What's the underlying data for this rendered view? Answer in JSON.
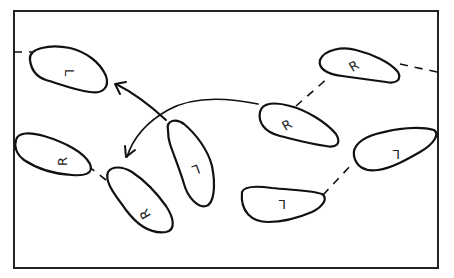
{
  "diagram": {
    "colors": {
      "ink": "#111111",
      "background": "#ffffff"
    },
    "footprints": [
      {
        "id": "f1",
        "side": "L",
        "label": "L",
        "cx": 64,
        "cy": 72
      },
      {
        "id": "f2",
        "side": "R",
        "label": "R",
        "cx": 52,
        "cy": 160
      },
      {
        "id": "f3",
        "side": "R",
        "label": "R",
        "cx": 142,
        "cy": 209
      },
      {
        "id": "f4",
        "side": "L",
        "label": "L",
        "cx": 195,
        "cy": 175
      },
      {
        "id": "f5",
        "side": "R",
        "label": "R",
        "cx": 290,
        "cy": 123
      },
      {
        "id": "f6",
        "side": "R",
        "label": "R",
        "cx": 353,
        "cy": 68
      },
      {
        "id": "f7",
        "side": "L",
        "label": "L",
        "cx": 394,
        "cy": 153
      },
      {
        "id": "f8",
        "side": "L",
        "label": "L",
        "cx": 282,
        "cy": 202
      }
    ],
    "connections": [
      {
        "from": "edge-left",
        "to": "f1",
        "style": "dashed"
      },
      {
        "from": "f2",
        "to": "f3",
        "style": "dashed"
      },
      {
        "from": "f5",
        "to": "f6",
        "style": "dashed"
      },
      {
        "from": "f6",
        "to": "edge-right",
        "style": "dashed"
      },
      {
        "from": "f8",
        "to": "f7",
        "style": "dashed"
      }
    ],
    "arrows": [
      {
        "from": "f4",
        "to": "f1",
        "style": "solid-curved"
      },
      {
        "from": "f5",
        "to": "f2",
        "style": "solid-curved"
      }
    ]
  }
}
